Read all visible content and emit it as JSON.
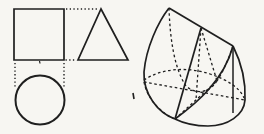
{
  "page": {
    "background": "#f7f6f2",
    "ink": "#1f1f1f"
  },
  "diagram": {
    "viewbox": "0 0 264 134",
    "dash_styles": {
      "solid": "",
      "dashed": "2.6 2.6",
      "dotted": "1.3 2.4"
    },
    "groups": [
      {
        "name": "orthographic-views",
        "shapes": [
          {
            "name": "front-view-square",
            "kind": "path",
            "d": "M14,9 L64,9 L64,60 L14,60 Z",
            "style": "solid",
            "w": 1.7
          },
          {
            "name": "side-view-triangle",
            "kind": "path",
            "d": "M101,9 L128,60 L78,60 Z",
            "style": "solid",
            "w": 1.7
          },
          {
            "name": "top-view-circle",
            "kind": "circle",
            "cx": 40,
            "cy": 100,
            "r": 24.5,
            "style": "solid",
            "w": 2
          },
          {
            "name": "projection-line-top",
            "kind": "path",
            "d": "M66,9 L99,9",
            "style": "dotted",
            "w": 1.4
          },
          {
            "name": "projection-line-base",
            "kind": "path",
            "d": "M65.5,60 L76.5,60",
            "style": "dotted",
            "w": 1.4
          },
          {
            "name": "projection-line-left",
            "kind": "path",
            "d": "M15,63 L15,87",
            "style": "dotted",
            "w": 1.4
          },
          {
            "name": "projection-line-right",
            "kind": "path",
            "d": "M64,63 L64,87",
            "style": "dotted",
            "w": 1.4
          },
          {
            "name": "center-tick",
            "kind": "path",
            "d": "M39.5,61 L40,63.5",
            "style": "solid",
            "w": 1.2
          }
        ]
      },
      {
        "name": "pictorial-solid",
        "shapes": [
          {
            "name": "left-silhouette-edge",
            "kind": "path",
            "d": "M169,8 C158,22 146,48 144,72 C143,94 158,113 175,119",
            "style": "solid",
            "w": 1.7
          },
          {
            "name": "top-ridge-edge",
            "kind": "path",
            "d": "M169,8 L233,46",
            "style": "solid",
            "w": 1.7
          },
          {
            "name": "front-slope-edge",
            "kind": "path",
            "d": "M201,28 L175,119",
            "style": "solid",
            "w": 1.7
          },
          {
            "name": "front-face-ellipse-edge",
            "kind": "path",
            "d": "M175,119 C197,103 224,80 233,46",
            "style": "solid",
            "w": 1.7
          },
          {
            "name": "base-outline-edge",
            "kind": "path",
            "d": "M233,46 C240,60 246,80 245,100 C244,115 228,126 208,126 C195,126 183,123 175,119",
            "style": "solid",
            "w": 1.7
          },
          {
            "name": "right-generator-edge",
            "kind": "path",
            "d": "M233,46 L233,113",
            "style": "solid",
            "w": 1.5
          },
          {
            "name": "hidden-face-arc-left",
            "kind": "path",
            "d": "M169,8 C170,38 174,68 186,86 C196,95 209,93 217,81",
            "style": "dashed",
            "w": 1.3
          },
          {
            "name": "hidden-face-arc-right",
            "kind": "path",
            "d": "M233,46 C228,60 223,72 217,81",
            "style": "dashed",
            "w": 1.3
          },
          {
            "name": "hidden-slope-line",
            "kind": "path",
            "d": "M201,28 L217,81",
            "style": "dashed",
            "w": 1.3
          },
          {
            "name": "axis-line",
            "kind": "path",
            "d": "M201,28 L196,100",
            "style": "dashed",
            "w": 1.3
          },
          {
            "name": "hidden-base-back-arc",
            "kind": "path",
            "d": "M144,80 C160,69 186,66 210,74 C228,80 240,88 244,98",
            "style": "dashed",
            "w": 1.3
          },
          {
            "name": "hidden-base-front-left-arc",
            "kind": "path",
            "d": "M144,82 C147,98 160,113 175,119",
            "style": "dashed",
            "w": 1.3
          },
          {
            "name": "base-diameter-front-back",
            "kind": "path",
            "d": "M175,119 L217,81",
            "style": "dashed",
            "w": 1.3
          },
          {
            "name": "base-diameter-left-right",
            "kind": "path",
            "d": "M144,82 L245,100",
            "style": "dashed",
            "w": 1.3
          }
        ]
      },
      {
        "name": "scan-artifacts",
        "shapes": [
          {
            "name": "edge-speck",
            "kind": "path",
            "d": "M133,93 L134,99",
            "style": "solid",
            "w": 1.6
          }
        ]
      }
    ]
  }
}
